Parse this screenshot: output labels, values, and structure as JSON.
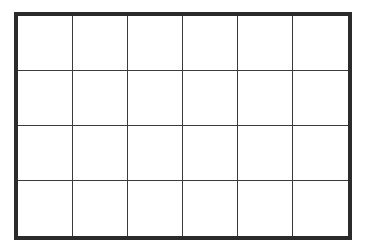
{
  "grid": {
    "rows": 4,
    "columns": 6,
    "border_color": "#2b2b2b",
    "line_color": "#3a3a3a",
    "cell_fill": "#ffffff"
  }
}
